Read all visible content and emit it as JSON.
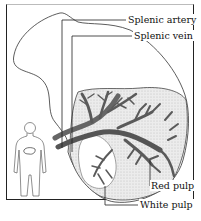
{
  "diagram": {
    "labels": {
      "splenic_artery": "Splenic artery",
      "splenic_vein": "Splenic vein",
      "red_pulp": "Red pulp",
      "white_pulp": "White pulp"
    },
    "colors": {
      "outline": "#333333",
      "vessel_dark": "#555555",
      "vessel_mid": "#7a7a7a",
      "pulp_fill": "#e6e6e6",
      "background": "#ffffff"
    },
    "inset": {
      "description": "Human body outline with spleen location indicated"
    }
  }
}
